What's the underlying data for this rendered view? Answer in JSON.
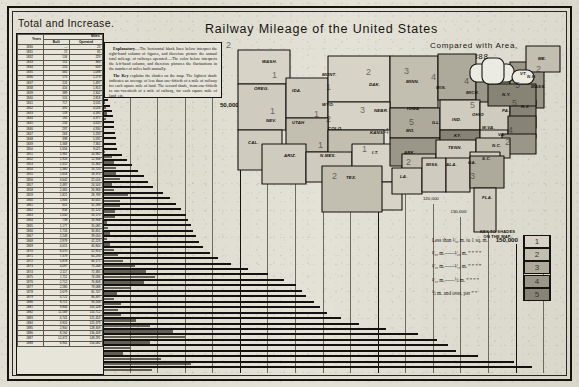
{
  "sheet": {
    "main_title": "Railway Mileage of the United States",
    "compared_line1": "Compared with Area,",
    "compared_line2": "1888.",
    "total_and_increase": "Total and Increase."
  },
  "explanatory": {
    "para1_lead": "Explanatory.",
    "para1": "—The horizontal black lines below interpret the right-hand column of figures, and therefore picture the annual total mileage of railways operated.—The color below interprets the left-hand column, and therefore pictures the fluctuations in the number of miles built annually.",
    "para2_lead": "The Key",
    "para2": " explains the shades on the map. The lightest shade indicates an average of less than one-fiftieth of a mile of railway for each square mile of land. The second shade, from one-fiftieth to one-twentieth of a mile of railway, for each square mile of land, etc."
  },
  "table": {
    "col_years": "Years",
    "col_group": "Miles.",
    "col_built": "Built",
    "col_operated": "Operated",
    "rows": [
      {
        "year": "1830",
        "built": "—",
        "operated": "23"
      },
      {
        "year": "1831",
        "built": "72",
        "operated": "95"
      },
      {
        "year": "1832",
        "built": "134",
        "operated": "229"
      },
      {
        "year": "1833",
        "built": "151",
        "operated": "380"
      },
      {
        "year": "1834",
        "built": "253",
        "operated": "633"
      },
      {
        "year": "1835",
        "built": "465",
        "operated": "1,098"
      },
      {
        "year": "1836",
        "built": "175",
        "operated": "1,273"
      },
      {
        "year": "1837",
        "built": "224",
        "operated": "1,497"
      },
      {
        "year": "1838",
        "built": "416",
        "operated": "1,913"
      },
      {
        "year": "1839",
        "built": "389",
        "operated": "2,302"
      },
      {
        "year": "1840",
        "built": "516",
        "operated": "2,818"
      },
      {
        "year": "1841",
        "built": "717",
        "operated": "3,535"
      },
      {
        "year": "1842",
        "built": "491",
        "operated": "4,026"
      },
      {
        "year": "1843",
        "built": "159",
        "operated": "4,185"
      },
      {
        "year": "1844",
        "built": "192",
        "operated": "4,377"
      },
      {
        "year": "1845",
        "built": "256",
        "operated": "4,633"
      },
      {
        "year": "1846",
        "built": "297",
        "operated": "4,930"
      },
      {
        "year": "1847",
        "built": "263",
        "operated": "5,193"
      },
      {
        "year": "1848",
        "built": "398",
        "operated": "5,591"
      },
      {
        "year": "1849",
        "built": "1,369",
        "operated": "7,365"
      },
      {
        "year": "1850",
        "built": "1,656",
        "operated": "9,021"
      },
      {
        "year": "1851",
        "built": "1,961",
        "operated": "10,982"
      },
      {
        "year": "1852",
        "built": "1,926",
        "operated": "12,908"
      },
      {
        "year": "1853",
        "built": "2,452",
        "operated": "15,360"
      },
      {
        "year": "1854",
        "built": "1,360",
        "operated": "16,720"
      },
      {
        "year": "1855",
        "built": "1,654",
        "operated": "18,374"
      },
      {
        "year": "1856",
        "built": "3,642",
        "operated": "22,016"
      },
      {
        "year": "1857",
        "built": "2,487",
        "operated": "24,503"
      },
      {
        "year": "1858",
        "built": "2,465",
        "operated": "26,968"
      },
      {
        "year": "1859",
        "built": "1,821",
        "operated": "28,789"
      },
      {
        "year": "1860",
        "built": "1,846",
        "operated": "30,635"
      },
      {
        "year": "1861",
        "built": "651",
        "operated": "31,286"
      },
      {
        "year": "1862",
        "built": "834",
        "operated": "32,120"
      },
      {
        "year": "1863",
        "built": "1,050",
        "operated": "33,170"
      },
      {
        "year": "1864",
        "built": "738",
        "operated": "33,908"
      },
      {
        "year": "1865",
        "built": "1,177",
        "operated": "35,085"
      },
      {
        "year": "1866",
        "built": "1,716",
        "operated": "36,801"
      },
      {
        "year": "1867",
        "built": "2,249",
        "operated": "39,050"
      },
      {
        "year": "1868",
        "built": "2,979",
        "operated": "42,229"
      },
      {
        "year": "1869",
        "built": "4,615",
        "operated": "46,844"
      },
      {
        "year": "1870",
        "built": "6,070",
        "operated": "52,914"
      },
      {
        "year": "1871",
        "built": "7,379",
        "operated": "60,293"
      },
      {
        "year": "1872",
        "built": "5,878",
        "operated": "66,171"
      },
      {
        "year": "1873",
        "built": "4,097",
        "operated": "70,268"
      },
      {
        "year": "1874",
        "built": "2,117",
        "operated": "72,385"
      },
      {
        "year": "1875",
        "built": "1,711",
        "operated": "74,096"
      },
      {
        "year": "1876",
        "built": "2,712",
        "operated": "76,808"
      },
      {
        "year": "1877",
        "built": "2,280",
        "operated": "79,088"
      },
      {
        "year": "1878",
        "built": "2,679",
        "operated": "81,747"
      },
      {
        "year": "1879",
        "built": "4,721",
        "operated": "86,497"
      },
      {
        "year": "1880",
        "built": "6,711",
        "operated": "93,208"
      },
      {
        "year": "1881",
        "built": "9,846",
        "operated": "103,108"
      },
      {
        "year": "1882",
        "built": "11,569",
        "operated": "114,712"
      },
      {
        "year": "1883",
        "built": "6,741",
        "operated": "121,453"
      },
      {
        "year": "1884",
        "built": "3,924",
        "operated": "125,379"
      },
      {
        "year": "1885",
        "built": "2,900",
        "operated": "128,309"
      },
      {
        "year": "1886",
        "built": "8,164",
        "operated": "136,409"
      },
      {
        "year": "1887",
        "built": "12,472",
        "operated": "149,291"
      },
      {
        "year": "1888",
        "built": "6,941",
        "operated": "156,082"
      }
    ]
  },
  "key": {
    "heading_line1": "KEY TO SHADES",
    "heading_line2": "ON THE MAP.",
    "rows": [
      {
        "text": "Less than ¹⁄₅₀ m. to 1 sq. m.",
        "swatch": "1"
      },
      {
        "text": "¹⁄₅₀ m.——¹⁄₂₀ m.  ”  ”  ”   ”",
        "swatch": "2"
      },
      {
        "text": "¹⁄₂₀ m.——¹⁄₁₀ m.  ”  ”  ”   ”",
        "swatch": "3"
      },
      {
        "text": "¹⁄₁₀ m.——½ m.  ”  ”  ”   ”",
        "swatch": "4"
      },
      {
        "text": "½ m. and over, per  ”   ”",
        "swatch": "5"
      }
    ]
  },
  "chart_data": {
    "type": "bar",
    "title": "Railway Mileage of the United States",
    "orientation": "horizontal",
    "xlabel": "Miles of railway operated",
    "ylabel": "Year",
    "xlim": [
      0,
      165000
    ],
    "grid": true,
    "gridlines": [
      {
        "value": 10000,
        "label": "10,000 Miles."
      },
      {
        "value": 20000,
        "label": "20,000"
      },
      {
        "value": 30000,
        "label": "30,000"
      },
      {
        "value": 40000,
        "label": "40,000"
      },
      {
        "value": 50000,
        "label": "50,000"
      },
      {
        "value": 60000,
        "label": "60,000"
      },
      {
        "value": 70000,
        "label": "70,000"
      },
      {
        "value": 80000,
        "label": "80,000"
      },
      {
        "value": 90000,
        "label": "90,000"
      },
      {
        "value": 100000,
        "label": "100,000"
      },
      {
        "value": 110000,
        "label": "110,000"
      },
      {
        "value": 120000,
        "label": "120,000"
      },
      {
        "value": 130000,
        "label": "130,000"
      },
      {
        "value": 140000,
        "label": "140,000"
      },
      {
        "value": 150000,
        "label": "150,000"
      },
      {
        "value": 160000,
        "label": "160,000"
      }
    ],
    "categories": [
      "1830",
      "1831",
      "1832",
      "1833",
      "1834",
      "1835",
      "1836",
      "1837",
      "1838",
      "1839",
      "1840",
      "1841",
      "1842",
      "1843",
      "1844",
      "1845",
      "1846",
      "1847",
      "1848",
      "1849",
      "1850",
      "1851",
      "1852",
      "1853",
      "1854",
      "1855",
      "1856",
      "1857",
      "1858",
      "1859",
      "1860",
      "1861",
      "1862",
      "1863",
      "1864",
      "1865",
      "1866",
      "1867",
      "1868",
      "1869",
      "1870",
      "1871",
      "1872",
      "1873",
      "1874",
      "1875",
      "1876",
      "1877",
      "1878",
      "1879",
      "1880",
      "1881",
      "1882",
      "1883",
      "1884",
      "1885",
      "1886",
      "1887",
      "1888"
    ],
    "series": [
      {
        "name": "Miles Operated",
        "values": [
          23,
          95,
          229,
          380,
          633,
          1098,
          1273,
          1497,
          1913,
          2302,
          2818,
          3535,
          4026,
          4185,
          4377,
          4633,
          4930,
          5193,
          5591,
          7365,
          9021,
          10982,
          12908,
          15360,
          16720,
          18374,
          22016,
          24503,
          26968,
          28789,
          30635,
          31286,
          32120,
          33170,
          33908,
          35085,
          36801,
          39050,
          42229,
          46844,
          52914,
          60293,
          66171,
          70268,
          72385,
          74096,
          76808,
          79088,
          81747,
          86497,
          93208,
          103108,
          114712,
          121453,
          125379,
          128309,
          136409,
          149291,
          156082
        ]
      },
      {
        "name": "Miles Built",
        "values": [
          0,
          72,
          134,
          151,
          253,
          465,
          175,
          224,
          416,
          389,
          516,
          717,
          491,
          159,
          192,
          256,
          297,
          263,
          398,
          1369,
          1656,
          1961,
          1926,
          2452,
          1360,
          1654,
          3642,
          2487,
          2465,
          1821,
          1846,
          651,
          834,
          1050,
          738,
          1177,
          1716,
          2249,
          2979,
          4615,
          6070,
          7379,
          5878,
          4097,
          2117,
          1711,
          2712,
          2280,
          2679,
          4721,
          6711,
          9846,
          11569,
          6741,
          3924,
          2900,
          8164,
          12472,
          6941
        ]
      }
    ]
  },
  "map": {
    "states": [
      {
        "abbr": "WASH.",
        "shade": "1",
        "x": 36,
        "y": 19,
        "nx": 46,
        "ny": 30
      },
      {
        "abbr": "OREG.",
        "shade": "",
        "x": 28,
        "y": 46,
        "nx": 0,
        "ny": 0
      },
      {
        "abbr": "IDA.",
        "shade": "",
        "x": 66,
        "y": 48,
        "nx": 0,
        "ny": 0
      },
      {
        "abbr": "MONT.",
        "shade": "1",
        "x": 96,
        "y": 32,
        "nx": 100,
        "ny": 42
      },
      {
        "abbr": "DAK.",
        "shade": "2",
        "x": 143,
        "y": 42,
        "nx": 140,
        "ny": 27
      },
      {
        "abbr": "MINN.",
        "shade": "3",
        "x": 180,
        "y": 39,
        "nx": 178,
        "ny": 26
      },
      {
        "abbr": "WIS.",
        "shade": "4",
        "x": 210,
        "y": 45,
        "nx": 205,
        "ny": 32
      },
      {
        "abbr": "MICH.",
        "shade": "4",
        "x": 240,
        "y": 50,
        "nx": 238,
        "ny": 36
      },
      {
        "abbr": "ME.",
        "shade": "2",
        "x": 312,
        "y": 16,
        "nx": 310,
        "ny": 24
      },
      {
        "abbr": "N.H.",
        "shade": "",
        "x": 301,
        "y": 34,
        "nx": 0,
        "ny": 0
      },
      {
        "abbr": "VT.",
        "shade": "",
        "x": 294,
        "y": 31,
        "nx": 0,
        "ny": 0
      },
      {
        "abbr": "MASS.",
        "shade": "",
        "x": 305,
        "y": 44,
        "nx": 0,
        "ny": 0
      },
      {
        "abbr": "N.Y.",
        "shade": "5",
        "x": 276,
        "y": 52,
        "nx": 289,
        "ny": 40
      },
      {
        "abbr": "WYO.",
        "shade": "1",
        "x": 96,
        "y": 62,
        "nx": 88,
        "ny": 69
      },
      {
        "abbr": "NEV.",
        "shade": "1",
        "x": 40,
        "y": 78,
        "nx": 44,
        "ny": 66
      },
      {
        "abbr": "UTAH",
        "shade": "2",
        "x": 66,
        "y": 80,
        "nx": 0,
        "ny": 0
      },
      {
        "abbr": "COLO.",
        "shade": "2",
        "x": 102,
        "y": 86,
        "nx": 100,
        "ny": 74
      },
      {
        "abbr": "NEBR.",
        "shade": "3",
        "x": 148,
        "y": 68,
        "nx": 134,
        "ny": 65
      },
      {
        "abbr": "IOWA",
        "shade": "",
        "x": 181,
        "y": 66,
        "nx": 0,
        "ny": 0
      },
      {
        "abbr": "ILL.",
        "shade": "",
        "x": 206,
        "y": 80,
        "nx": 0,
        "ny": 0
      },
      {
        "abbr": "IND.",
        "shade": "",
        "x": 226,
        "y": 77,
        "nx": 0,
        "ny": 0
      },
      {
        "abbr": "OHIO",
        "shade": "5",
        "x": 246,
        "y": 72,
        "nx": 244,
        "ny": 60
      },
      {
        "abbr": "PA.",
        "shade": "5",
        "x": 276,
        "y": 68,
        "nx": 286,
        "ny": 58
      },
      {
        "abbr": "N.J.",
        "shade": "",
        "x": 295,
        "y": 64,
        "nx": 0,
        "ny": 0
      },
      {
        "abbr": "CAL.",
        "shade": "",
        "x": 22,
        "y": 100,
        "nx": 0,
        "ny": 0
      },
      {
        "abbr": "ARIZ.",
        "shade": "",
        "x": 58,
        "y": 113,
        "nx": 0,
        "ny": 0
      },
      {
        "abbr": "N.MEX.",
        "shade": "1",
        "x": 94,
        "y": 113,
        "nx": 92,
        "ny": 100
      },
      {
        "abbr": "KANS.",
        "shade": "4",
        "x": 144,
        "y": 90,
        "nx": 158,
        "ny": 86
      },
      {
        "abbr": "MO.",
        "shade": "5",
        "x": 180,
        "y": 88,
        "nx": 183,
        "ny": 77
      },
      {
        "abbr": "KY.",
        "shade": "",
        "x": 228,
        "y": 93,
        "nx": 0,
        "ny": 0
      },
      {
        "abbr": "W.VA.",
        "shade": "",
        "x": 256,
        "y": 85,
        "nx": 0,
        "ny": 0
      },
      {
        "abbr": "VA.",
        "shade": "4",
        "x": 272,
        "y": 92,
        "nx": 282,
        "ny": 85
      },
      {
        "abbr": "I.T.",
        "shade": "1",
        "x": 146,
        "y": 110,
        "nx": 136,
        "ny": 104
      },
      {
        "abbr": "ARK.",
        "shade": "2",
        "x": 178,
        "y": 110,
        "nx": 180,
        "ny": 117
      },
      {
        "abbr": "TENN.",
        "shade": "",
        "x": 222,
        "y": 105,
        "nx": 0,
        "ny": 0
      },
      {
        "abbr": "N.C.",
        "shade": "2",
        "x": 266,
        "y": 103,
        "nx": 279,
        "ny": 97
      },
      {
        "abbr": "S.C.",
        "shade": "",
        "x": 256,
        "y": 116,
        "nx": 0,
        "ny": 0
      },
      {
        "abbr": "TEX.",
        "shade": "2",
        "x": 120,
        "y": 135,
        "nx": 106,
        "ny": 131
      },
      {
        "abbr": "LA.",
        "shade": "",
        "x": 174,
        "y": 134,
        "nx": 0,
        "ny": 0
      },
      {
        "abbr": "MISS.",
        "shade": "",
        "x": 200,
        "y": 122,
        "nx": 0,
        "ny": 0
      },
      {
        "abbr": "ALA.",
        "shade": "",
        "x": 220,
        "y": 122,
        "nx": 0,
        "ny": 0
      },
      {
        "abbr": "GA.",
        "shade": "3",
        "x": 242,
        "y": 120,
        "nx": 244,
        "ny": 131
      },
      {
        "abbr": "FLA.",
        "shade": "",
        "x": 256,
        "y": 155,
        "nx": 0,
        "ny": 0
      }
    ]
  }
}
